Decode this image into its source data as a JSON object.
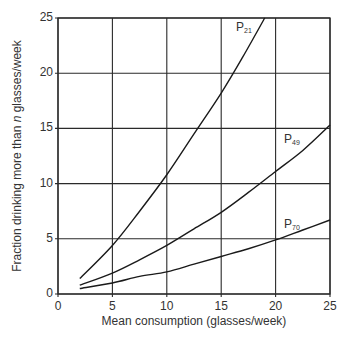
{
  "chart_data": {
    "type": "line",
    "title": "",
    "xlabel": "Mean consumption (glasses/week)",
    "ylabel_parts": [
      "Fraction drinking more than ",
      "n",
      " glasses/week"
    ],
    "ylabel": "Fraction drinking more than n glasses/week",
    "xlim": [
      0,
      25
    ],
    "ylim": [
      0,
      25
    ],
    "xticks": [
      0,
      5,
      10,
      15,
      20,
      25
    ],
    "yticks": [
      0,
      5,
      10,
      15,
      20,
      25
    ],
    "grid": true,
    "legend_position": "inline labels",
    "series": [
      {
        "name": "P21",
        "label_main": "P",
        "label_sub": "21",
        "x": [
          2,
          5,
          7.5,
          10,
          12.5,
          15,
          17,
          19
        ],
        "y": [
          1.4,
          4.4,
          7.5,
          10.8,
          14.5,
          18.2,
          21.5,
          25
        ]
      },
      {
        "name": "P49",
        "label_main": "P",
        "label_sub": "49",
        "x": [
          2,
          5,
          7.5,
          10,
          12.5,
          15,
          17.5,
          20,
          22.5,
          25
        ],
        "y": [
          0.8,
          1.9,
          3.1,
          4.4,
          5.9,
          7.4,
          9.2,
          11.1,
          13.0,
          15.3
        ]
      },
      {
        "name": "P70",
        "label_main": "P",
        "label_sub": "70",
        "x": [
          2,
          5,
          7.5,
          10,
          12.5,
          15,
          17.5,
          20,
          22.5,
          25
        ],
        "y": [
          0.5,
          1.0,
          1.6,
          2.0,
          2.7,
          3.4,
          4.1,
          4.9,
          5.8,
          6.7
        ]
      }
    ]
  },
  "colors": {
    "line": "#1a1a1a",
    "grid": "#2a2a2a",
    "text": "#333333"
  }
}
